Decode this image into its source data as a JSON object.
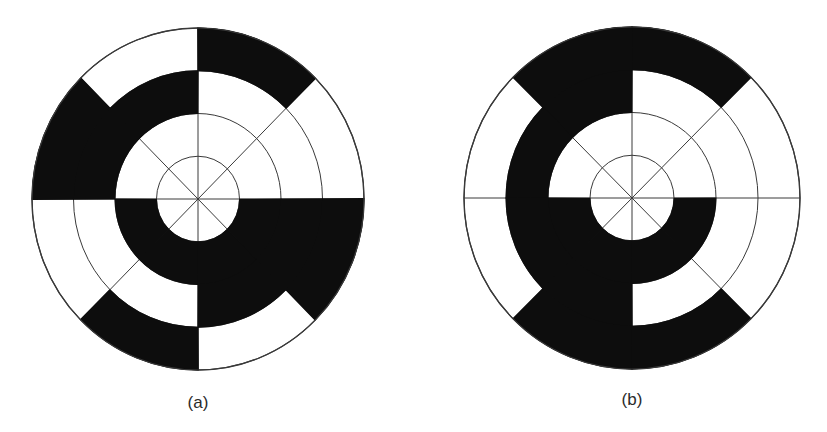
{
  "figure": {
    "colors": {
      "background": "#ffffff",
      "filled": "#0d0d0d",
      "line": "#3a3a3a"
    },
    "ring_radius_fractions": [
      0.25,
      0.5,
      0.75,
      1.0
    ],
    "sector_count": 8,
    "sector_note": "sector k spans 45k to 45(k+1) degrees counter-clockwise from the positive x axis (east); ring 0 is innermost",
    "disks": [
      {
        "id": "a",
        "label": "(a)",
        "center": [
          198,
          199
        ],
        "radius_x": 166,
        "radius_y": 171,
        "label_position": [
          198,
          408
        ],
        "rings": [
          [
            0,
            0,
            0,
            0,
            0,
            0,
            0,
            0
          ],
          [
            0,
            0,
            0,
            0,
            1,
            1,
            1,
            1
          ],
          [
            0,
            0,
            1,
            1,
            0,
            0,
            1,
            1
          ],
          [
            0,
            1,
            0,
            1,
            0,
            1,
            0,
            1
          ]
        ]
      },
      {
        "id": "b",
        "label": "(b)",
        "center": [
          632,
          198
        ],
        "radius_x": 168,
        "radius_y": 171,
        "label_position": [
          632,
          405
        ],
        "rings": [
          [
            0,
            0,
            0,
            0,
            0,
            0,
            0,
            0
          ],
          [
            0,
            0,
            0,
            0,
            1,
            1,
            1,
            1
          ],
          [
            0,
            0,
            1,
            1,
            1,
            1,
            0,
            0
          ],
          [
            0,
            1,
            1,
            0,
            0,
            1,
            1,
            0
          ]
        ]
      }
    ]
  }
}
